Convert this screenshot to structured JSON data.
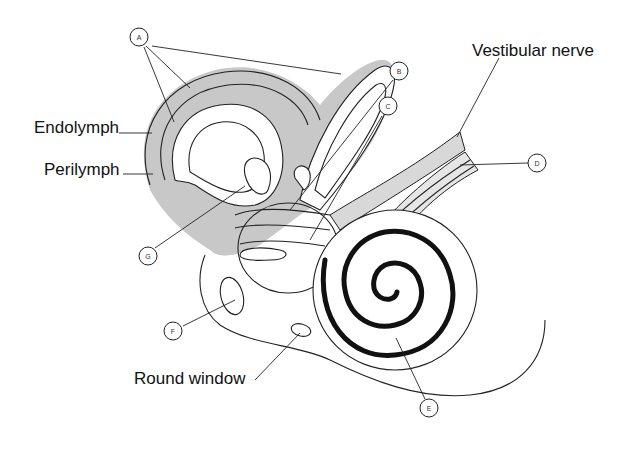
{
  "text_labels": {
    "endolymph": "Endolymph",
    "perilymph": "Perilymph",
    "vestibular_nerve": "Vestibular nerve",
    "round_window": "Round window"
  },
  "letter_labels": {
    "a": "A",
    "b": "B",
    "c": "C",
    "d": "D",
    "e": "E",
    "f": "F",
    "g": "G"
  },
  "colors": {
    "line": "#222222",
    "perilymph_shade": "#c8c8c8",
    "cochlea_spiral": "#111111",
    "background": "#ffffff"
  }
}
